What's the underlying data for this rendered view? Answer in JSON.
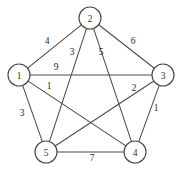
{
  "figure": {
    "background_color": "#ffffff",
    "line_color": "#4a4a4a",
    "text_color": "#2b2b2b"
  },
  "chart_data": {
    "type": "diagram",
    "diagram_type": "weighted-undirected-graph",
    "title": "",
    "xlabel": "",
    "ylabel": "",
    "grid": false,
    "legend": null,
    "node_radius": 11,
    "nodes": [
      {
        "id": "1",
        "label": "1",
        "x": 19,
        "y": 75
      },
      {
        "id": "2",
        "label": "2",
        "x": 90,
        "y": 18
      },
      {
        "id": "3",
        "label": "3",
        "x": 163,
        "y": 75
      },
      {
        "id": "4",
        "label": "4",
        "x": 135,
        "y": 152
      },
      {
        "id": "5",
        "label": "5",
        "x": 46,
        "y": 152
      }
    ],
    "edges": [
      {
        "source": "1",
        "target": "2",
        "weight": "4",
        "label_x": 47,
        "label_y": 41
      },
      {
        "source": "2",
        "target": "3",
        "weight": "6",
        "label_x": 133,
        "label_y": 41
      },
      {
        "source": "1",
        "target": "3",
        "weight": "9",
        "label_x": 56,
        "label_y": 67
      },
      {
        "source": "1",
        "target": "5",
        "weight": "3",
        "label_x": 22,
        "label_y": 113
      },
      {
        "source": "5",
        "target": "4",
        "weight": "7",
        "label_x": 92,
        "label_y": 158
      },
      {
        "source": "2",
        "target": "5",
        "weight": "3",
        "label_x": 72,
        "label_y": 52
      },
      {
        "source": "2",
        "target": "4",
        "weight": "5",
        "label_x": 101,
        "label_y": 52
      },
      {
        "source": "1",
        "target": "4",
        "weight": "1",
        "label_x": 49,
        "label_y": 86
      },
      {
        "source": "3",
        "target": "5",
        "weight": "2",
        "label_x": 134,
        "label_y": 88
      },
      {
        "source": "3",
        "target": "4",
        "weight": "1",
        "label_x": 156,
        "label_y": 108
      }
    ]
  }
}
